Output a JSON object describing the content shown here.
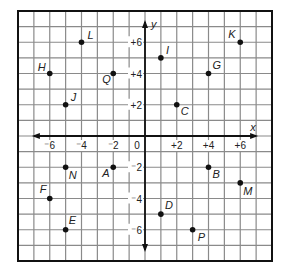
{
  "chart_data": {
    "type": "scatter",
    "title": "",
    "xlabel": "x",
    "ylabel": "y",
    "xlim": [
      -8,
      8
    ],
    "ylim": [
      -8,
      8
    ],
    "grid": true,
    "origin_label": "0",
    "x_ticks": [
      {
        "value": -6,
        "label": "⁻6"
      },
      {
        "value": -4,
        "label": "⁻4"
      },
      {
        "value": -2,
        "label": "⁻2"
      },
      {
        "value": 2,
        "label": "+2"
      },
      {
        "value": 4,
        "label": "+4"
      },
      {
        "value": 6,
        "label": "+6"
      }
    ],
    "y_ticks": [
      {
        "value": 6,
        "label": "+6"
      },
      {
        "value": 4,
        "label": "+4"
      },
      {
        "value": 2,
        "label": "+2"
      },
      {
        "value": -2,
        "label": "⁻2"
      },
      {
        "value": -4,
        "label": "⁻4"
      },
      {
        "value": -6,
        "label": "⁻6"
      }
    ],
    "points": [
      {
        "name": "L",
        "x": -4,
        "y": 6,
        "lx": 6,
        "ly": -3
      },
      {
        "name": "H",
        "x": -6,
        "y": 4,
        "lx": -12,
        "ly": -3
      },
      {
        "name": "Q",
        "x": -2,
        "y": 4,
        "lx": -11,
        "ly": 9
      },
      {
        "name": "J",
        "x": -5,
        "y": 2,
        "lx": 5,
        "ly": -4
      },
      {
        "name": "I",
        "x": 1,
        "y": 5,
        "lx": 5,
        "ly": -4
      },
      {
        "name": "K",
        "x": 6,
        "y": 6,
        "lx": -12,
        "ly": -4
      },
      {
        "name": "G",
        "x": 4,
        "y": 4,
        "lx": 4,
        "ly": -5
      },
      {
        "name": "C",
        "x": 2,
        "y": 2,
        "lx": 4,
        "ly": 10
      },
      {
        "name": "N",
        "x": -5,
        "y": -2,
        "lx": 3,
        "ly": 12
      },
      {
        "name": "A",
        "x": -2,
        "y": -2,
        "lx": -11,
        "ly": 10
      },
      {
        "name": "F",
        "x": -6,
        "y": -4,
        "lx": -10,
        "ly": -6
      },
      {
        "name": "E",
        "x": -5,
        "y": -6,
        "lx": 3,
        "ly": -6
      },
      {
        "name": "B",
        "x": 4,
        "y": -2,
        "lx": 4,
        "ly": 11
      },
      {
        "name": "M",
        "x": 6,
        "y": -3,
        "lx": 3,
        "ly": 12
      },
      {
        "name": "D",
        "x": 1,
        "y": -5,
        "lx": 4,
        "ly": -5
      },
      {
        "name": "P",
        "x": 3,
        "y": -6,
        "lx": 5,
        "ly": 11
      }
    ]
  },
  "colors": {
    "grid": "#8a8a8a",
    "border": "#111111",
    "axis": "#111111",
    "point": "#111111"
  }
}
